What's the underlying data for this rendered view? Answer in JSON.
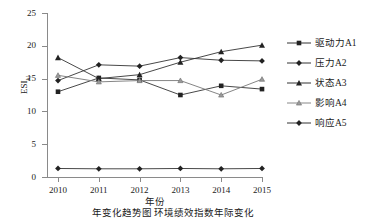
{
  "chart_data": {
    "type": "line",
    "title": "",
    "xlabel": "年份",
    "ylabel": "ESI",
    "ylabel_sub": "kj",
    "categories": [
      "2010",
      "2011",
      "2012",
      "2013",
      "2014",
      "2015"
    ],
    "x": [
      2010,
      2011,
      2012,
      2013,
      2014,
      2015
    ],
    "ylim": [
      0,
      25
    ],
    "yticks": [
      0,
      5,
      10,
      15,
      20,
      25
    ],
    "ytick_labels": [
      "0",
      "5",
      "10",
      "15",
      "20",
      "25"
    ],
    "grid": false,
    "legend_position": "right",
    "series": [
      {
        "name": "驱动力A1",
        "marker": "square",
        "color": "#222222",
        "values": [
          13.0,
          15.1,
          14.8,
          12.5,
          13.9,
          13.4
        ]
      },
      {
        "name": "压力A2",
        "marker": "diamond",
        "color": "#222222",
        "values": [
          14.7,
          17.1,
          16.9,
          18.2,
          17.8,
          17.7
        ]
      },
      {
        "name": "状态A3",
        "marker": "triangle",
        "color": "#222222",
        "values": [
          18.2,
          15.0,
          15.6,
          17.5,
          19.1,
          20.1
        ]
      },
      {
        "name": "影响A4",
        "marker": "triangle-small",
        "color": "#555555",
        "values": [
          15.5,
          14.5,
          14.7,
          14.7,
          12.5,
          14.9
        ]
      },
      {
        "name": "响应A5",
        "marker": "diamond",
        "color": "#222222",
        "values": [
          1.3,
          1.25,
          1.25,
          1.3,
          1.25,
          1.3
        ]
      }
    ]
  },
  "caption": "年变化趋势图 环境绩效指数年际变化"
}
